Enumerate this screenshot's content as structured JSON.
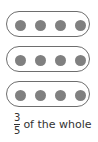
{
  "diagram": {
    "groups": [
      {
        "dots": 4
      },
      {
        "dots": 4
      },
      {
        "dots": 4
      }
    ],
    "dot_color": "#808080",
    "border_color": "#6e6e6e"
  },
  "caption": {
    "numerator": "3",
    "denominator": "5",
    "text": "of the whole"
  }
}
